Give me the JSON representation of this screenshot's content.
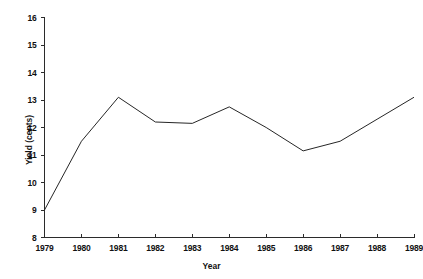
{
  "chart_data": {
    "type": "line",
    "title": "",
    "xlabel": "Year",
    "ylabel": "Yield (cents)",
    "categories": [
      "1979",
      "1980",
      "1981",
      "1982",
      "1983",
      "1984",
      "1985",
      "1986",
      "1987",
      "1988",
      "1989"
    ],
    "x": [
      1979,
      1980,
      1981,
      1982,
      1983,
      1984,
      1985,
      1986,
      1987,
      1988,
      1989
    ],
    "values": [
      9.0,
      11.5,
      13.1,
      12.2,
      12.15,
      12.75,
      12.0,
      11.15,
      11.5,
      12.3,
      13.1
    ],
    "series": [
      {
        "name": "Yield",
        "values": [
          9.0,
          11.5,
          13.1,
          12.2,
          12.15,
          12.75,
          12.0,
          11.15,
          11.5,
          12.3,
          13.1
        ]
      }
    ],
    "xlim": [
      1979,
      1989
    ],
    "ylim": [
      8,
      16
    ],
    "ytick_labels": [
      "8",
      "9",
      "10",
      "11",
      "12",
      "13",
      "14",
      "15",
      "16"
    ],
    "yticks": [
      8,
      9,
      10,
      11,
      12,
      13,
      14,
      15,
      16
    ],
    "xtick_labels": [
      "1979",
      "1980",
      "1981",
      "1982",
      "1983",
      "1984",
      "1985",
      "1986",
      "1987",
      "1988",
      "1989"
    ],
    "grid": false,
    "legend": false,
    "legend_position": "none",
    "line_color": "#262626",
    "axis_color": "#2b2b2b",
    "background_color": "#ffffff"
  },
  "axes": {
    "ylabel": "Yield (cents)",
    "xlabel": "Year"
  }
}
